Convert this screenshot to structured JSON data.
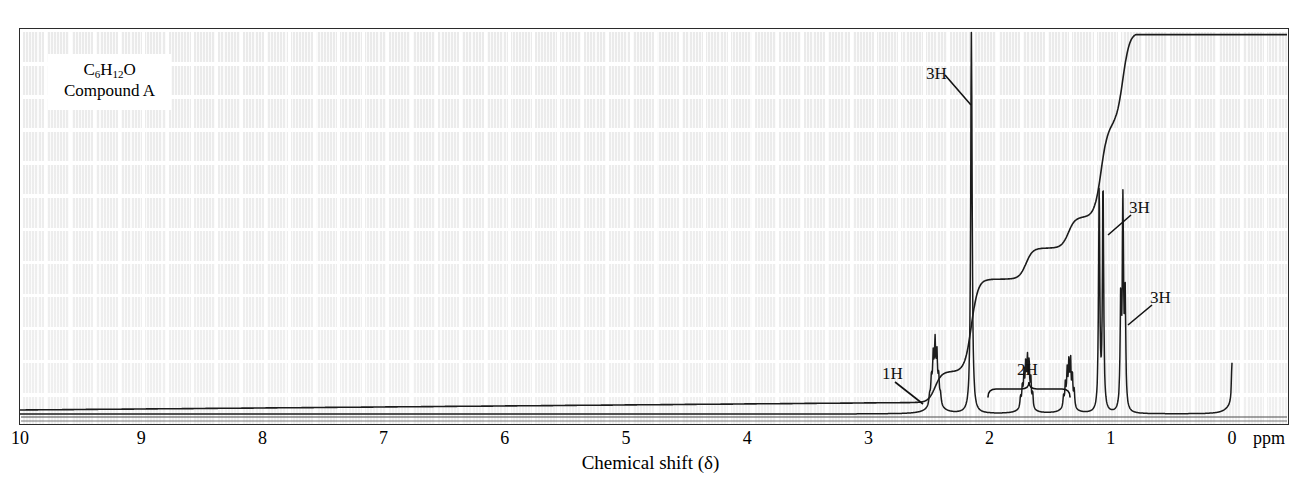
{
  "figure": {
    "kind": "nmr-spectrum",
    "sample": {
      "formula_prefix": "C",
      "formula_c_sub": "6",
      "formula_h": "H",
      "formula_h_sub": "12",
      "formula_o": "O",
      "formula_plain": "C6H12O",
      "compound_name": "Compound A"
    },
    "axis": {
      "title": "Chemical shift (δ)",
      "unit_label": "ppm",
      "ticks": [
        "10",
        "9",
        "8",
        "7",
        "6",
        "5",
        "4",
        "3",
        "2",
        "1",
        "0"
      ],
      "tick_values": [
        10,
        9,
        8,
        7,
        6,
        5,
        4,
        3,
        2,
        1,
        0
      ],
      "range_ppm": [
        10,
        0
      ],
      "direction": "right-to-left-decreasing"
    },
    "annotations": [
      {
        "label": "3H",
        "shift_ppm": 2.15,
        "style": "leader-line"
      },
      {
        "label": "3H",
        "shift_ppm": 1.08,
        "style": "leader-line"
      },
      {
        "label": "3H",
        "shift_ppm": 0.9,
        "style": "leader-line"
      },
      {
        "label": "1H",
        "shift_ppm": 2.45,
        "style": "leader-line"
      },
      {
        "label": "2H",
        "shift_ppm": 1.52,
        "style": "brace"
      }
    ],
    "colors": {
      "trace": "#1c1c1c",
      "paper": "#eeeeee",
      "gridline": "#ffffff",
      "frame": "#2b2b2b",
      "label_box": "#ffffff"
    }
  },
  "chart_data": {
    "type": "line",
    "title": "",
    "subtitle": "",
    "xlabel": "Chemical shift (δ)",
    "ylabel": "",
    "xlim": [
      10,
      0
    ],
    "ylim": [
      0,
      1
    ],
    "grid": true,
    "legend": "none",
    "x_unit": "ppm",
    "x_ticks": [
      10,
      9,
      8,
      7,
      6,
      5,
      4,
      3,
      2,
      1,
      0
    ],
    "series": [
      {
        "name": "1H NMR spectrum",
        "type": "spectrum",
        "peaks": [
          {
            "shift_ppm": 2.45,
            "label": "1H",
            "multiplicity": "multiplet (septet-like)",
            "rel_height": 0.14,
            "integration_H": 1
          },
          {
            "shift_ppm": 2.15,
            "label": "3H",
            "multiplicity": "singlet",
            "rel_height": 1.0,
            "integration_H": 3
          },
          {
            "shift_ppm": 1.7,
            "label": "2H",
            "multiplicity": "multiplet",
            "rel_height": 0.11,
            "integration_H": 1
          },
          {
            "shift_ppm": 1.35,
            "label": "2H",
            "multiplicity": "multiplet",
            "rel_height": 0.11,
            "integration_H": 1
          },
          {
            "shift_ppm": 1.08,
            "label": "3H",
            "multiplicity": "doublet",
            "rel_height": 0.6,
            "integration_H": 3
          },
          {
            "shift_ppm": 0.9,
            "label": "3H",
            "multiplicity": "triplet",
            "rel_height": 0.53,
            "integration_H": 3
          },
          {
            "shift_ppm": 0.0,
            "label": "TMS",
            "multiplicity": "singlet",
            "rel_height": 0.11,
            "integration_H": 0
          }
        ]
      },
      {
        "name": "integration curve",
        "type": "step-integral",
        "steps": [
          {
            "shift_ppm": 2.45,
            "step_height_H": 1
          },
          {
            "shift_ppm": 2.15,
            "step_height_H": 3
          },
          {
            "shift_ppm": 1.7,
            "step_height_H": 1
          },
          {
            "shift_ppm": 1.35,
            "step_height_H": 1
          },
          {
            "shift_ppm": 1.08,
            "step_height_H": 3
          },
          {
            "shift_ppm": 0.9,
            "step_height_H": 3
          },
          {
            "shift_ppm": 0.0,
            "step_height_H": 0
          }
        ],
        "total_H": 12
      }
    ]
  }
}
